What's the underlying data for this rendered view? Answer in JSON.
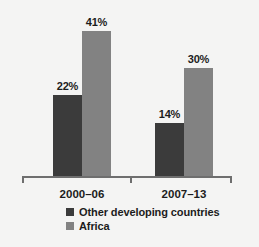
{
  "chart_data": {
    "type": "bar",
    "title": "",
    "subtitle": "",
    "xlabel": "",
    "ylabel": "",
    "categories": [
      "2000–06",
      "2007–13"
    ],
    "series": [
      {
        "name": "Other developing countries",
        "color": "#3b3b3b",
        "values": [
          22,
          14
        ],
        "labels": [
          "22%",
          "30%"
        ]
      },
      {
        "name": "Africa",
        "color": "#828282",
        "values": [
          41,
          30
        ],
        "labels": [
          "41%",
          "30%"
        ]
      }
    ],
    "value_labels": [
      [
        "22%",
        "41%"
      ],
      [
        "14%",
        "30%"
      ]
    ],
    "ylim": [
      0,
      45
    ],
    "grid": false,
    "legend_position": "bottom",
    "units": "percent"
  },
  "axis": {
    "ticks": [
      22,
      131,
      232
    ],
    "baseline_color": "#6e6e6e"
  },
  "legend": {
    "items": [
      {
        "label": "Other developing countries",
        "color": "#3b3b3b"
      },
      {
        "label": "Africa",
        "color": "#828282"
      }
    ]
  },
  "bars": [
    {
      "name": "bar-2000-06-other-developing-countries",
      "label": "22%",
      "value": 22,
      "color": "#3b3b3b",
      "left": 53,
      "width": 29,
      "height": 83,
      "label_left": 50,
      "label_top": 80
    },
    {
      "name": "bar-2000-06-africa",
      "label": "41%",
      "value": 41,
      "color": "#828282",
      "left": 82,
      "width": 29,
      "height": 147,
      "label_left": 79,
      "label_top": 16
    },
    {
      "name": "bar-2007-13-other-developing-countries",
      "label": "14%",
      "value": 14,
      "color": "#3b3b3b",
      "left": 155,
      "width": 29,
      "height": 55,
      "label_left": 152,
      "label_top": 108
    },
    {
      "name": "bar-2007-13-africa",
      "label": "30%",
      "value": 30,
      "color": "#828282",
      "left": 184,
      "width": 29,
      "height": 110,
      "label_left": 181,
      "label_top": 53
    }
  ],
  "category_labels": [
    {
      "text": "2000–06",
      "left": 47,
      "width": 70
    },
    {
      "text": "2007–13",
      "left": 149,
      "width": 70
    }
  ]
}
